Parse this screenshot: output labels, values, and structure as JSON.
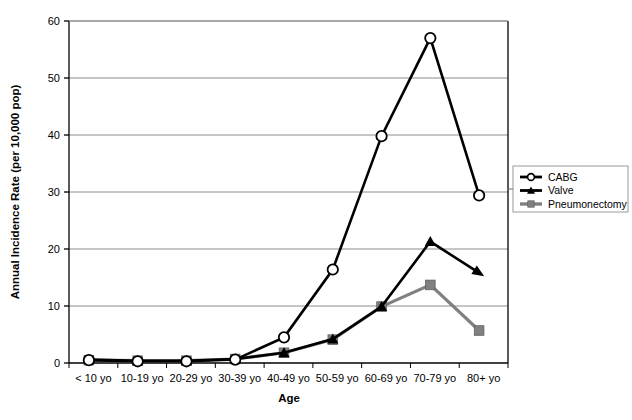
{
  "chart_data": {
    "type": "line",
    "title": "",
    "xlabel": "Age",
    "ylabel": "Annual Incidence Rate (per 10,000 pop)",
    "categories": [
      "< 10 yo",
      "10-19 yo",
      "20-29 yo",
      "30-39 yo",
      "40-49 yo",
      "50-59 yo",
      "60-69 yo",
      "70-79 yo",
      "80+ yo"
    ],
    "ylim": [
      0,
      60
    ],
    "yticks": [
      0,
      10,
      20,
      30,
      40,
      50,
      60
    ],
    "ytick_labels": [
      "0",
      "10",
      "20",
      "30",
      "40",
      "50",
      "60"
    ],
    "grid": "horizontal",
    "legend_position": "right",
    "series": [
      {
        "name": "CABG",
        "color": "#000000",
        "marker": "open-circle",
        "values": [
          0.5,
          0.3,
          0.3,
          0.6,
          4.5,
          16.4,
          39.8,
          57.0,
          29.4
        ]
      },
      {
        "name": "Valve",
        "color": "#000000",
        "marker": "filled-triangle",
        "values": [
          0.6,
          0.4,
          0.4,
          0.7,
          1.8,
          4.2,
          9.9,
          21.3,
          15.8
        ]
      },
      {
        "name": "Pneumonectomy",
        "color": "#808080",
        "marker": "filled-square",
        "values": [
          0.5,
          0.4,
          0.4,
          0.7,
          1.8,
          4.1,
          9.9,
          13.7,
          5.7
        ]
      }
    ]
  },
  "legend": {
    "items": [
      {
        "label": "CABG"
      },
      {
        "label": "Valve"
      },
      {
        "label": "Pneumonectomy"
      }
    ]
  },
  "colors": {
    "series_black": "#000000",
    "series_gray": "#808080",
    "gridline": "#8c8c8c",
    "axis": "#000000",
    "background": "#ffffff"
  }
}
